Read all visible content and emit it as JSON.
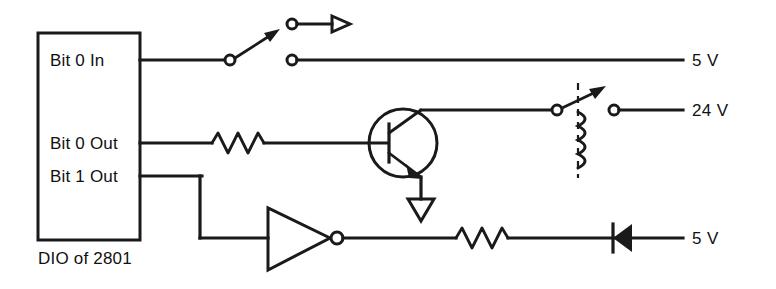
{
  "diagram": {
    "caption": "DIO of 2801",
    "line_color": "#1a1a1a",
    "background": "#ffffff",
    "device_block": {
      "name": "DIO of 2801",
      "pins": [
        {
          "label": "Bit 0 In",
          "type": "input"
        },
        {
          "label": "Bit 0 Out",
          "type": "output"
        },
        {
          "label": "Bit 1 Out",
          "type": "output"
        }
      ]
    },
    "nets": [
      {
        "name": "bit-0-in-net",
        "source_pin": "Bit 0 In",
        "supply_label": "5 V",
        "components": [
          "switch",
          "terminal-upper",
          "terminal-lower",
          "arrowhead"
        ]
      },
      {
        "name": "bit-0-out-net",
        "source_pin": "Bit 0 Out",
        "supply_label": "24 V",
        "components": [
          "resistor",
          "npn-transistor",
          "ground",
          "relay-contact",
          "relay-coil"
        ]
      },
      {
        "name": "bit-1-out-net",
        "source_pin": "Bit 1 Out",
        "supply_label": "5 V",
        "components": [
          "inverter",
          "resistor",
          "diode"
        ]
      }
    ],
    "labels": {
      "pin_bit0_in": "Bit 0 In",
      "pin_bit0_out": "Bit 0 Out",
      "pin_bit1_out": "Bit 1 Out",
      "supply_top": "5 V",
      "supply_middle": "24 V",
      "supply_bottom": "5 V",
      "block_caption": "DIO of 2801"
    },
    "icon_names": {
      "switch": "spst-switch-icon",
      "arrowhead": "signal-arrow-icon",
      "resistor": "resistor-icon",
      "transistor": "npn-transistor-icon",
      "ground": "ground-icon",
      "relay": "relay-icon",
      "coil": "coil-icon",
      "inverter": "inverter-gate-icon",
      "diode": "diode-icon",
      "terminal": "terminal-node-icon"
    }
  }
}
